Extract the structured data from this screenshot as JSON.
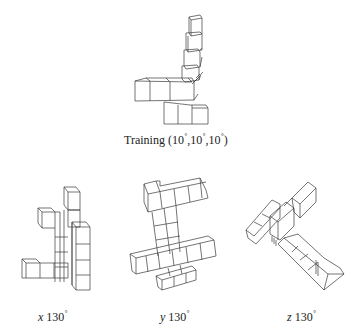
{
  "figure": {
    "panels": [
      {
        "id": "training",
        "caption_prefix": "Training (",
        "angles": [
          "10",
          "10",
          "10"
        ],
        "caption_suffix": ")",
        "degree_symbol": "°"
      },
      {
        "id": "x",
        "axis": "x",
        "angle": "130",
        "degree_symbol": "°"
      },
      {
        "id": "y",
        "axis": "y",
        "angle": "130",
        "degree_symbol": "°"
      },
      {
        "id": "z",
        "axis": "z",
        "angle": "130",
        "degree_symbol": "°"
      }
    ]
  }
}
